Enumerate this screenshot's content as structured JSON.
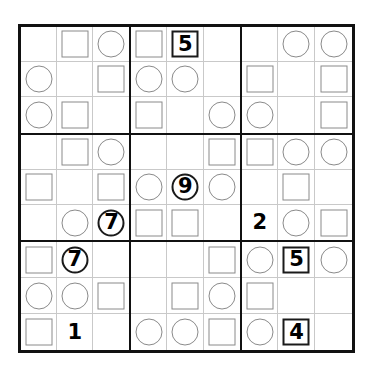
{
  "page": {
    "width": 371,
    "height": 374,
    "background_color": "#ffffff"
  },
  "grid": {
    "rows": 9,
    "columns": 9,
    "box_rows": 3,
    "box_columns": 3,
    "outer_border_color": "#111111",
    "box_border_color": "#111111",
    "cell_border_color": "#c9c9c9",
    "shape_outline_color": "#8a8a8a",
    "digit_color": "#000000",
    "legend": {
      "square": "square-marker",
      "circle": "circle-marker",
      "none": "empty-cell"
    },
    "cells": [
      [
        {
          "shape": "none",
          "digit": ""
        },
        {
          "shape": "square",
          "digit": ""
        },
        {
          "shape": "circle",
          "digit": ""
        },
        {
          "shape": "square",
          "digit": ""
        },
        {
          "shape": "square",
          "digit": "5"
        },
        {
          "shape": "none",
          "digit": ""
        },
        {
          "shape": "none",
          "digit": ""
        },
        {
          "shape": "circle",
          "digit": ""
        },
        {
          "shape": "circle",
          "digit": ""
        }
      ],
      [
        {
          "shape": "circle",
          "digit": ""
        },
        {
          "shape": "none",
          "digit": ""
        },
        {
          "shape": "square",
          "digit": ""
        },
        {
          "shape": "circle",
          "digit": ""
        },
        {
          "shape": "circle",
          "digit": ""
        },
        {
          "shape": "none",
          "digit": ""
        },
        {
          "shape": "square",
          "digit": ""
        },
        {
          "shape": "none",
          "digit": ""
        },
        {
          "shape": "square",
          "digit": ""
        }
      ],
      [
        {
          "shape": "circle",
          "digit": ""
        },
        {
          "shape": "square",
          "digit": ""
        },
        {
          "shape": "none",
          "digit": ""
        },
        {
          "shape": "square",
          "digit": ""
        },
        {
          "shape": "none",
          "digit": ""
        },
        {
          "shape": "circle",
          "digit": ""
        },
        {
          "shape": "circle",
          "digit": ""
        },
        {
          "shape": "none",
          "digit": ""
        },
        {
          "shape": "square",
          "digit": ""
        }
      ],
      [
        {
          "shape": "none",
          "digit": ""
        },
        {
          "shape": "square",
          "digit": ""
        },
        {
          "shape": "circle",
          "digit": ""
        },
        {
          "shape": "none",
          "digit": ""
        },
        {
          "shape": "none",
          "digit": ""
        },
        {
          "shape": "square",
          "digit": ""
        },
        {
          "shape": "square",
          "digit": ""
        },
        {
          "shape": "circle",
          "digit": ""
        },
        {
          "shape": "circle",
          "digit": ""
        }
      ],
      [
        {
          "shape": "square",
          "digit": ""
        },
        {
          "shape": "none",
          "digit": ""
        },
        {
          "shape": "square",
          "digit": ""
        },
        {
          "shape": "circle",
          "digit": ""
        },
        {
          "shape": "circle",
          "digit": "9"
        },
        {
          "shape": "circle",
          "digit": ""
        },
        {
          "shape": "none",
          "digit": ""
        },
        {
          "shape": "square",
          "digit": ""
        },
        {
          "shape": "none",
          "digit": ""
        }
      ],
      [
        {
          "shape": "none",
          "digit": ""
        },
        {
          "shape": "circle",
          "digit": ""
        },
        {
          "shape": "circle",
          "digit": "7"
        },
        {
          "shape": "square",
          "digit": ""
        },
        {
          "shape": "square",
          "digit": ""
        },
        {
          "shape": "none",
          "digit": ""
        },
        {
          "shape": "none",
          "digit": "2"
        },
        {
          "shape": "circle",
          "digit": ""
        },
        {
          "shape": "square",
          "digit": ""
        }
      ],
      [
        {
          "shape": "square",
          "digit": ""
        },
        {
          "shape": "circle",
          "digit": "7"
        },
        {
          "shape": "none",
          "digit": ""
        },
        {
          "shape": "none",
          "digit": ""
        },
        {
          "shape": "none",
          "digit": ""
        },
        {
          "shape": "square",
          "digit": ""
        },
        {
          "shape": "circle",
          "digit": ""
        },
        {
          "shape": "square",
          "digit": "5"
        },
        {
          "shape": "circle",
          "digit": ""
        }
      ],
      [
        {
          "shape": "circle",
          "digit": ""
        },
        {
          "shape": "circle",
          "digit": ""
        },
        {
          "shape": "square",
          "digit": ""
        },
        {
          "shape": "none",
          "digit": ""
        },
        {
          "shape": "square",
          "digit": ""
        },
        {
          "shape": "circle",
          "digit": ""
        },
        {
          "shape": "square",
          "digit": ""
        },
        {
          "shape": "none",
          "digit": ""
        },
        {
          "shape": "none",
          "digit": ""
        }
      ],
      [
        {
          "shape": "square",
          "digit": ""
        },
        {
          "shape": "none",
          "digit": "1"
        },
        {
          "shape": "none",
          "digit": ""
        },
        {
          "shape": "circle",
          "digit": ""
        },
        {
          "shape": "circle",
          "digit": ""
        },
        {
          "shape": "square",
          "digit": ""
        },
        {
          "shape": "circle",
          "digit": ""
        },
        {
          "shape": "square",
          "digit": "4"
        },
        {
          "shape": "none",
          "digit": ""
        }
      ]
    ]
  },
  "chart_data": {
    "type": "table",
    "xlabel": "column",
    "ylabel": "row",
    "categories": [
      "c1",
      "c2",
      "c3",
      "c4",
      "c5",
      "c6",
      "c7",
      "c8",
      "c9"
    ],
    "row_labels": [
      "r1",
      "r2",
      "r3",
      "r4",
      "r5",
      "r6",
      "r7",
      "r8",
      "r9"
    ],
    "shape_matrix": [
      [
        "none",
        "square",
        "circle",
        "square",
        "square",
        "none",
        "none",
        "circle",
        "circle"
      ],
      [
        "circle",
        "none",
        "square",
        "circle",
        "circle",
        "none",
        "square",
        "none",
        "square"
      ],
      [
        "circle",
        "square",
        "none",
        "square",
        "none",
        "circle",
        "circle",
        "none",
        "square"
      ],
      [
        "none",
        "square",
        "circle",
        "none",
        "none",
        "square",
        "square",
        "circle",
        "circle"
      ],
      [
        "square",
        "none",
        "square",
        "circle",
        "circle",
        "circle",
        "none",
        "square",
        "none"
      ],
      [
        "none",
        "circle",
        "circle",
        "square",
        "square",
        "none",
        "none",
        "circle",
        "square"
      ],
      [
        "square",
        "circle",
        "none",
        "none",
        "none",
        "square",
        "circle",
        "square",
        "circle"
      ],
      [
        "circle",
        "circle",
        "square",
        "none",
        "square",
        "circle",
        "square",
        "none",
        "none"
      ],
      [
        "square",
        "none",
        "none",
        "circle",
        "circle",
        "square",
        "circle",
        "square",
        "none"
      ]
    ],
    "digit_matrix": [
      [
        "",
        "",
        "",
        "",
        "5",
        "",
        "",
        "",
        ""
      ],
      [
        "",
        "",
        "",
        "",
        "",
        "",
        "",
        "",
        ""
      ],
      [
        "",
        "",
        "",
        "",
        "",
        "",
        "",
        "",
        ""
      ],
      [
        "",
        "",
        "",
        "",
        "",
        "",
        "",
        "",
        ""
      ],
      [
        "",
        "",
        "",
        "",
        "9",
        "",
        "",
        "",
        ""
      ],
      [
        "",
        "",
        "7",
        "",
        "",
        "",
        "2",
        "",
        ""
      ],
      [
        "",
        "7",
        "",
        "",
        "",
        "",
        "",
        "5",
        ""
      ],
      [
        "",
        "",
        "",
        "",
        "",
        "",
        "",
        "",
        ""
      ],
      [
        "",
        "1",
        "",
        "",
        "",
        "",
        "",
        "4",
        ""
      ]
    ],
    "given_clues": [
      {
        "row": 1,
        "col": 5,
        "digit": "5",
        "shape": "square"
      },
      {
        "row": 5,
        "col": 5,
        "digit": "9",
        "shape": "circle"
      },
      {
        "row": 6,
        "col": 3,
        "digit": "7",
        "shape": "circle"
      },
      {
        "row": 6,
        "col": 7,
        "digit": "2",
        "shape": "none"
      },
      {
        "row": 7,
        "col": 2,
        "digit": "7",
        "shape": "circle"
      },
      {
        "row": 7,
        "col": 8,
        "digit": "5",
        "shape": "square"
      },
      {
        "row": 9,
        "col": 2,
        "digit": "1",
        "shape": "none"
      },
      {
        "row": 9,
        "col": 8,
        "digit": "4",
        "shape": "square"
      }
    ],
    "counts": {
      "squares": 27,
      "circles": 27,
      "empty": 27,
      "given_digits": 8
    }
  }
}
